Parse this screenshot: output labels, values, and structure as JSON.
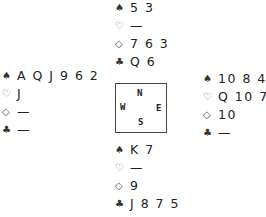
{
  "suits": {
    "spades": "♠",
    "hearts": "♡",
    "diamonds": "◇",
    "clubs": "♣"
  },
  "compass": {
    "north": "N",
    "south": "S",
    "west": "W",
    "east": "E"
  },
  "hands": {
    "north": {
      "spades": "5 3",
      "hearts": "—",
      "diamonds": "7 6 3",
      "clubs": "Q 6"
    },
    "west": {
      "spades": "A Q J 9 6 2",
      "hearts": "J",
      "diamonds": "—",
      "clubs": "—"
    },
    "east": {
      "spades": "10 8 4",
      "hearts": "Q 10 7",
      "diamonds": "10",
      "clubs": "—"
    },
    "south": {
      "spades": "K 7",
      "hearts": "—",
      "diamonds": "9",
      "clubs": "J 8 7 5"
    }
  }
}
